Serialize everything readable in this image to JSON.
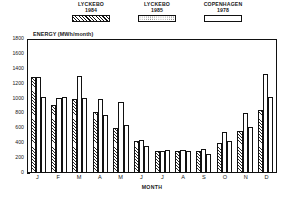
{
  "legend": {
    "items": [
      {
        "label": "LYCKEBO\n1984",
        "pattern": "hatch",
        "left": 63,
        "width": 56
      },
      {
        "label": "LYCKEBO\n1985",
        "pattern": "dot",
        "left": 131,
        "width": 52
      },
      {
        "label": "COPENHAGEN\n1978",
        "pattern": "plain",
        "left": 192,
        "width": 62
      }
    ]
  },
  "axes": {
    "ylabel": "ENERGY  (MWh/month)",
    "xlabel": "MONTH",
    "yticks": [
      0,
      200,
      400,
      600,
      800,
      1000,
      1200,
      1400,
      1600,
      1800
    ],
    "ymin": 0,
    "ymax": 1800
  },
  "chart_data": {
    "type": "bar",
    "title": "",
    "xlabel": "MONTH",
    "ylabel": "ENERGY  (MWh/month)",
    "ylim": [
      0,
      1800
    ],
    "grid": false,
    "legend_position": "top",
    "categories": [
      "J",
      "F",
      "M",
      "A",
      "M",
      "J",
      "J",
      "A",
      "S",
      "O",
      "N",
      "D"
    ],
    "series": [
      {
        "name": "LYCKEBO 1984",
        "pattern": "hatch",
        "values": [
          1290,
          920,
          1000,
          820,
          600,
          420,
          290,
          280,
          280,
          400,
          560,
          850
        ]
      },
      {
        "name": "LYCKEBO 1985",
        "pattern": "dot",
        "values": [
          1300,
          1010,
          1310,
          1000,
          960,
          430,
          290,
          300,
          310,
          540,
          800,
          1340
        ]
      },
      {
        "name": "COPENHAGEN 1978",
        "pattern": "plain",
        "values": [
          1020,
          1020,
          1010,
          780,
          640,
          350,
          300,
          290,
          250,
          420,
          620,
          1020
        ]
      }
    ]
  }
}
